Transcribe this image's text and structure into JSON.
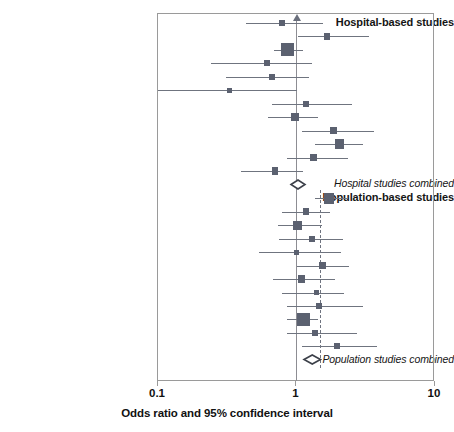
{
  "figure": {
    "type": "forest-plot",
    "axis_title": "Odds ratio and 95% confidence interval"
  },
  "axis": {
    "scale": "log",
    "min": 0.1,
    "max": 10,
    "ticks": [
      {
        "value": 0.1,
        "label": "0.1"
      },
      {
        "value": 1,
        "label": "1"
      },
      {
        "value": 10,
        "label": "10"
      }
    ],
    "reference_line": 1,
    "dashed_reference_line": 1.48
  },
  "group_labels": {
    "hospital_heading": "Hospital-based studies",
    "hospital_summary": "Hospital studies combined",
    "population_heading": "Population-based studies",
    "population_summary": "Population studies combined"
  },
  "colors": {
    "marker": "#5b6170",
    "line": "#6f747f",
    "frame": "#9a9a9a",
    "reference": "#8d8d93",
    "dashed_reference": "#6e737f",
    "text": "#111111"
  },
  "chart_data": {
    "type": "forest",
    "title": "",
    "xlabel": "Odds ratio and 95% confidence interval",
    "ylabel": "",
    "xlim": [
      0.1,
      10
    ],
    "xscale": "log",
    "grid": false,
    "legend": "none",
    "reference_value": 1,
    "dashed_reference_value": 1.48,
    "groups": [
      {
        "name": "Hospital-based studies",
        "studies": [
          {
            "or": 0.78,
            "lo": 0.43,
            "hi": 1.55,
            "weight": 3
          },
          {
            "or": 1.66,
            "lo": 1.03,
            "hi": 3.35,
            "weight": 3
          },
          {
            "or": 0.86,
            "lo": 0.69,
            "hi": 1.12,
            "weight": 10
          },
          {
            "or": 0.61,
            "lo": 0.24,
            "hi": 1.3,
            "weight": 3
          },
          {
            "or": 0.67,
            "lo": 0.31,
            "hi": 1.24,
            "weight": 3
          },
          {
            "or": 0.33,
            "lo": 0.1,
            "hi": 1.0,
            "weight": 2
          },
          {
            "or": 1.18,
            "lo": 0.66,
            "hi": 2.5,
            "weight": 3
          },
          {
            "or": 0.97,
            "lo": 0.62,
            "hi": 1.42,
            "weight": 5
          },
          {
            "or": 1.85,
            "lo": 1.1,
            "hi": 3.6,
            "weight": 4
          },
          {
            "or": 2.05,
            "lo": 1.35,
            "hi": 3.0,
            "weight": 7
          },
          {
            "or": 1.33,
            "lo": 0.85,
            "hi": 2.35,
            "weight": 4
          },
          {
            "or": 0.7,
            "lo": 0.4,
            "hi": 1.12,
            "weight": 4
          }
        ],
        "summary": {
          "or": 1.02,
          "lo": 0.92,
          "hi": 1.16,
          "label": "Hospital studies combined"
        }
      },
      {
        "name": "Population-based studies",
        "studies": [
          {
            "or": 1.72,
            "lo": 1.35,
            "hi": 2.35,
            "weight": 8
          },
          {
            "or": 1.17,
            "lo": 0.78,
            "hi": 1.75,
            "weight": 4
          },
          {
            "or": 1.02,
            "lo": 0.74,
            "hi": 1.52,
            "weight": 6
          },
          {
            "or": 1.3,
            "lo": 0.75,
            "hi": 2.15,
            "weight": 3
          },
          {
            "or": 1.0,
            "lo": 0.54,
            "hi": 2.1,
            "weight": 2
          },
          {
            "or": 1.55,
            "lo": 1.0,
            "hi": 2.4,
            "weight": 4
          },
          {
            "or": 1.08,
            "lo": 0.68,
            "hi": 1.9,
            "weight": 4
          },
          {
            "or": 1.4,
            "lo": 0.78,
            "hi": 2.2,
            "weight": 2
          },
          {
            "or": 1.45,
            "lo": 0.85,
            "hi": 3.0,
            "weight": 3
          },
          {
            "or": 1.12,
            "lo": 0.86,
            "hi": 1.42,
            "weight": 10
          },
          {
            "or": 1.36,
            "lo": 0.85,
            "hi": 2.75,
            "weight": 3
          },
          {
            "or": 1.95,
            "lo": 1.1,
            "hi": 3.8,
            "weight": 3
          }
        ],
        "summary": {
          "or": 1.3,
          "lo": 1.14,
          "hi": 1.5,
          "label": "Population studies combined"
        }
      }
    ]
  }
}
